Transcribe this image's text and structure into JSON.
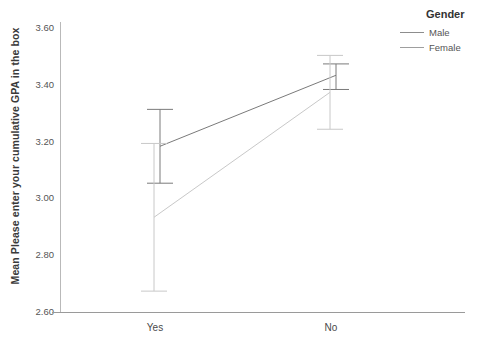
{
  "chart_data": {
    "type": "line",
    "title": "",
    "xlabel": "",
    "ylabel": "Mean Please enter your cumulative GPA in the box",
    "categories": [
      "Yes",
      "No"
    ],
    "ylim": [
      2.6,
      3.6
    ],
    "yticks": [
      "2.60",
      "2.80",
      "3.00",
      "3.20",
      "3.40",
      "3.60"
    ],
    "ytick_values": [
      2.6,
      2.8,
      3.0,
      3.2,
      3.4,
      3.6
    ],
    "grid": false,
    "legend_position": "top-right",
    "legend_title": "Gender",
    "series": [
      {
        "name": "Male",
        "color": "#7a7a7a",
        "values": [
          3.18,
          3.43
        ],
        "error_low": [
          3.05,
          3.38
        ],
        "error_high": [
          3.31,
          3.47
        ]
      },
      {
        "name": "Female",
        "color": "#c8c8c8",
        "values": [
          2.93,
          3.37
        ],
        "error_low": [
          2.67,
          3.24
        ],
        "error_high": [
          3.19,
          3.5
        ]
      }
    ]
  },
  "legend": {
    "title": "Gender",
    "items": [
      {
        "label": "Male",
        "color": "#8d8d8d"
      },
      {
        "label": "Female",
        "color": "#9e9e9e"
      }
    ]
  },
  "axes": {
    "y_title": "Mean Please enter your cumulative GPA in the box",
    "y_ticks": [
      "3.60",
      "3.40",
      "3.20",
      "3.00",
      "2.80",
      "2.60"
    ],
    "x_ticks": [
      "Yes",
      "No"
    ]
  }
}
